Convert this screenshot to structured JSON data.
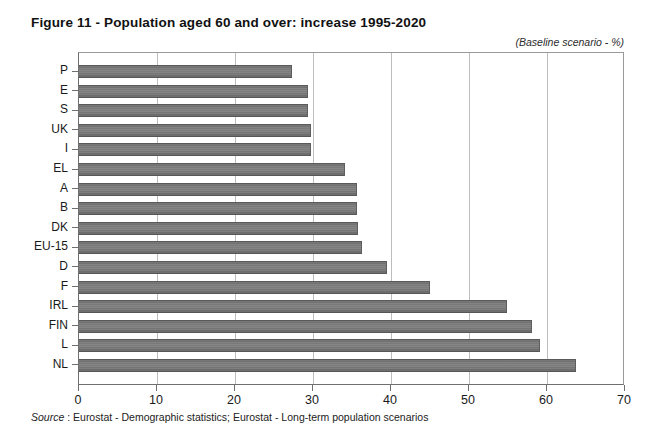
{
  "figure": {
    "title": "Figure 11 - Population aged 60 and over: increase 1995-2020",
    "subtitle": "(Baseline scenario - %)",
    "source_label": "Source",
    "source_text": " : Eurostat - Demographic statistics; Eurostat - Long-term population scenarios"
  },
  "chart_data": {
    "type": "bar",
    "orientation": "horizontal",
    "title": "Figure 11 - Population aged 60 and over: increase 1995-2020",
    "subtitle": "(Baseline scenario - %)",
    "xlabel": "",
    "ylabel": "",
    "xlim": [
      0,
      70
    ],
    "xticks": [
      0,
      10,
      20,
      30,
      40,
      50,
      60,
      70
    ],
    "xtick_labels": [
      "0",
      "10",
      "20",
      "30",
      "40",
      "50",
      "60",
      "70"
    ],
    "grid": true,
    "grid_axis": "x",
    "legend": false,
    "bar_color": "#7c7c7c",
    "categories": [
      "P",
      "E",
      "S",
      "UK",
      "I",
      "EL",
      "A",
      "B",
      "DK",
      "EU-15",
      "D",
      "F",
      "IRL",
      "FIN",
      "L",
      "NL"
    ],
    "values": [
      27.3,
      29.4,
      29.4,
      29.7,
      29.8,
      34.1,
      35.6,
      35.6,
      35.8,
      36.3,
      39.5,
      45.0,
      54.9,
      58.1,
      59.1,
      63.7
    ],
    "series": [
      {
        "name": "Increase 1995-2020 (%)",
        "values": [
          27.3,
          29.4,
          29.4,
          29.7,
          29.8,
          34.1,
          35.6,
          35.6,
          35.8,
          36.3,
          39.5,
          45.0,
          54.9,
          58.1,
          59.1,
          63.7
        ]
      }
    ],
    "points": [
      {
        "category": "P",
        "value": 27.3
      },
      {
        "category": "E",
        "value": 29.4
      },
      {
        "category": "S",
        "value": 29.4
      },
      {
        "category": "UK",
        "value": 29.7
      },
      {
        "category": "I",
        "value": 29.8
      },
      {
        "category": "EL",
        "value": 34.1
      },
      {
        "category": "A",
        "value": 35.6
      },
      {
        "category": "B",
        "value": 35.6
      },
      {
        "category": "DK",
        "value": 35.8
      },
      {
        "category": "EU-15",
        "value": 36.3
      },
      {
        "category": "D",
        "value": 39.5
      },
      {
        "category": "F",
        "value": 45.0
      },
      {
        "category": "IRL",
        "value": 54.9
      },
      {
        "category": "FIN",
        "value": 58.1
      },
      {
        "category": "L",
        "value": 59.1
      },
      {
        "category": "NL",
        "value": 63.7
      }
    ]
  }
}
